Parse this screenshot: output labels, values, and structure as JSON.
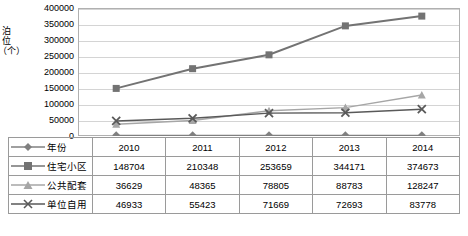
{
  "chart_data": {
    "type": "line",
    "title": "",
    "xlabel": "",
    "ylabel": "泊位（个）",
    "categories": [
      "2010",
      "2011",
      "2012",
      "2013",
      "2014"
    ],
    "ylim": [
      0,
      400000
    ],
    "yticks": [
      "0",
      "50000",
      "100000",
      "150000",
      "200000",
      "250000",
      "300000",
      "350000",
      "400000"
    ],
    "grid": true,
    "legend_position": "table-below",
    "series": [
      {
        "name": "年份",
        "marker": "diamond",
        "color": "#808080",
        "values": [
          2010,
          2011,
          2012,
          2013,
          2014
        ],
        "plotted_values": [
          2010,
          2011,
          2012,
          2013,
          2014
        ]
      },
      {
        "name": "住宅小区",
        "marker": "square",
        "color": "#737373",
        "values": [
          148704,
          210348,
          253659,
          344171,
          374673
        ]
      },
      {
        "name": "公共配套",
        "marker": "triangle",
        "color": "#a6a6a6",
        "values": [
          36629,
          48365,
          78805,
          88783,
          128247
        ]
      },
      {
        "name": "单位自用",
        "marker": "cross",
        "color": "#595959",
        "values": [
          46933,
          55423,
          71669,
          72693,
          83778
        ]
      }
    ]
  },
  "table": {
    "header_row": [
      "年份",
      "2010",
      "2011",
      "2012",
      "2013",
      "2014"
    ],
    "rows": [
      {
        "label": "住宅小区",
        "marker": "square",
        "cells": [
          "148704",
          "210348",
          "253659",
          "344171",
          "374673"
        ]
      },
      {
        "label": "公共配套",
        "marker": "triangle",
        "cells": [
          "36629",
          "48365",
          "78805",
          "88783",
          "128247"
        ]
      },
      {
        "label": "单位自用",
        "marker": "cross",
        "cells": [
          "46933",
          "55423",
          "71669",
          "72693",
          "83778"
        ]
      }
    ]
  }
}
